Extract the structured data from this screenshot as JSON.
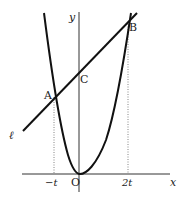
{
  "diagram": {
    "type": "coordinate-graph",
    "axes": {
      "x_label": "x",
      "y_label": "y",
      "origin_label": "O"
    },
    "points": {
      "A": "A",
      "B": "B",
      "C": "C"
    },
    "line_label": "ℓ",
    "tick_labels": {
      "neg_t": "−t",
      "two_t": "2t"
    },
    "colors": {
      "curve": "#111111",
      "axis": "#333333",
      "guide": "#555555",
      "background": "#ffffff"
    }
  }
}
